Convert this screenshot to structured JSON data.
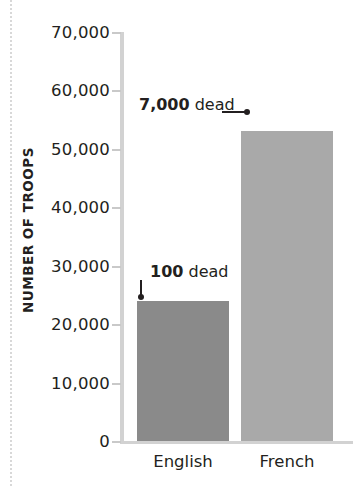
{
  "chart_data": {
    "type": "bar",
    "title": "",
    "subtitle": "",
    "xlabel": "",
    "ylabel": "NUMBER OF TROOPS",
    "categories": [
      "English",
      "French"
    ],
    "values": [
      24000,
      53000
    ],
    "series": [
      {
        "name": "Number of troops",
        "values": [
          24000,
          53000
        ]
      }
    ],
    "ylim": [
      0,
      70000
    ],
    "ytick_values": [
      0,
      10000,
      20000,
      30000,
      40000,
      50000,
      60000,
      70000
    ],
    "ytick_labels": [
      "0",
      "10,000",
      "20,000",
      "30,000",
      "40,000",
      "50,000",
      "60,000",
      "70,000"
    ],
    "grid": false,
    "legend": false,
    "legend_position": "none",
    "bar_colors": [
      "#8a8a8a",
      "#a9a9a9"
    ],
    "annotations": [
      {
        "id": "french-deaths",
        "value": "7,000",
        "word": "dead",
        "target_category": "French",
        "arrow_direction": "right"
      },
      {
        "id": "english-deaths",
        "value": "100",
        "word": "dead",
        "target_category": "English",
        "arrow_direction": "down"
      }
    ]
  },
  "colors": {
    "axis": "#d2d2d2",
    "text": "#231f20",
    "background": "#ffffff",
    "english_bar": "#8a8a8a",
    "french_bar": "#a9a9a9"
  }
}
